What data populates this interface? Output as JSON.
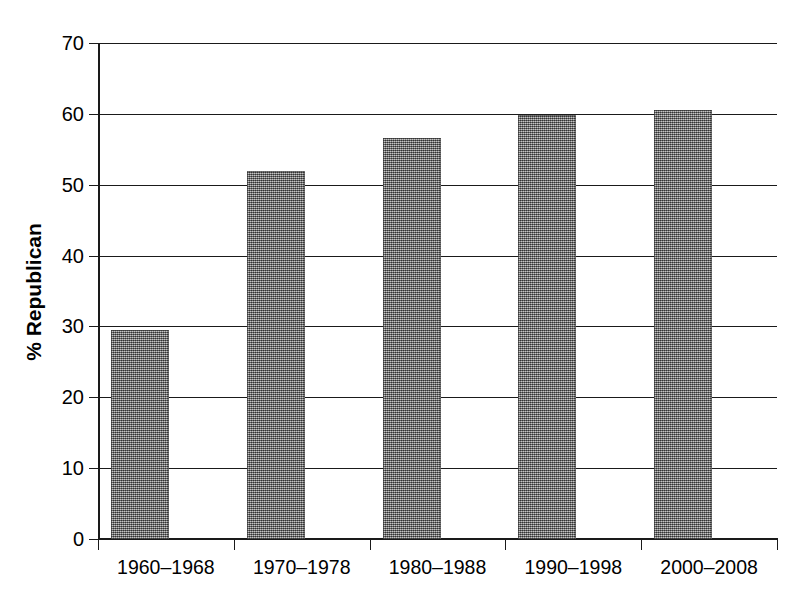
{
  "chart_data": {
    "type": "bar",
    "title": "",
    "xlabel": "",
    "ylabel": "% Republican",
    "categories": [
      "1960–1968",
      "1970–1978",
      "1980–1988",
      "1990–1998",
      "2000–2008"
    ],
    "values": [
      29.5,
      52.0,
      56.6,
      59.8,
      60.5
    ],
    "ylim": [
      0,
      70
    ],
    "ytick_labels": [
      "70",
      "60",
      "50",
      "40",
      "30",
      "20",
      "10",
      "0"
    ],
    "ytick_values": [
      70,
      60,
      50,
      40,
      30,
      20,
      10,
      0
    ],
    "ytick_step": 10,
    "grid": "horizontal",
    "legend": "none",
    "bar_color": "#8a8a8a",
    "bar_pattern": "dithered-gray-halftone",
    "axis_color": "#1a1a1a",
    "background_color": "#ffffff"
  }
}
